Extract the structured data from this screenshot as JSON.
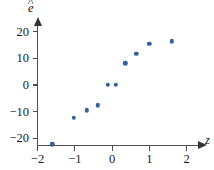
{
  "figure": {
    "background_color": "#ffffff",
    "point_color": "#33629c",
    "axis_color": "#4d4d4d"
  },
  "axes": {
    "y": {
      "title_base": "e",
      "title_accent": "^",
      "title_full": "ê",
      "ticks": [
        {
          "label": "20",
          "value": 20
        },
        {
          "label": "10",
          "value": 10
        },
        {
          "label": "0",
          "value": 0
        },
        {
          "label": "−10",
          "value": -10
        },
        {
          "label": "−20",
          "value": -20
        }
      ]
    },
    "x": {
      "title": "z",
      "ticks": [
        {
          "label": "−2",
          "value": -2
        },
        {
          "label": "−1",
          "value": -1
        },
        {
          "label": "0",
          "value": 0
        },
        {
          "label": "1",
          "value": 1
        },
        {
          "label": "2",
          "value": 2
        }
      ]
    }
  },
  "chart_data": {
    "type": "scatter",
    "title": "",
    "xlabel": "z",
    "ylabel": "ê",
    "xlim": [
      -2.15,
      2.4
    ],
    "ylim": [
      -26,
      24
    ],
    "grid": false,
    "legend": null,
    "xticks": [
      -2,
      -1,
      0,
      1,
      2
    ],
    "yticks": [
      -20,
      -10,
      0,
      10,
      20
    ],
    "x": [
      -1.6,
      -1.03,
      -0.67,
      -0.38,
      -0.12,
      0.1,
      0.35,
      0.65,
      1.0,
      1.6
    ],
    "y": [
      -22.3,
      -12.3,
      -9.5,
      -7.7,
      0.0,
      0.0,
      8.2,
      11.8,
      15.6,
      16.4
    ],
    "points": [
      {
        "x": -1.6,
        "y": -22.3
      },
      {
        "x": -1.03,
        "y": -12.3
      },
      {
        "x": -0.67,
        "y": -9.5
      },
      {
        "x": -0.38,
        "y": -7.7
      },
      {
        "x": -0.12,
        "y": 0.0
      },
      {
        "x": 0.1,
        "y": 0.0
      },
      {
        "x": 0.35,
        "y": 8.2
      },
      {
        "x": 0.65,
        "y": 11.8
      },
      {
        "x": 1.0,
        "y": 15.6
      },
      {
        "x": 1.6,
        "y": 16.4
      }
    ]
  }
}
